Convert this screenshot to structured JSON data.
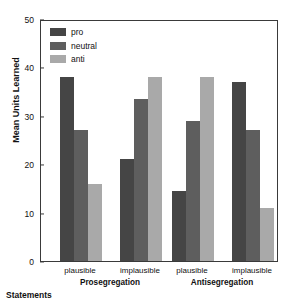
{
  "chart_data": {
    "type": "bar",
    "title": "",
    "xlabel": "Statements",
    "ylabel": "Mean Units Learned",
    "ylim": [
      0,
      50
    ],
    "yticks": [
      0,
      10,
      20,
      30,
      40,
      50
    ],
    "grid": false,
    "legend_position": "top-left",
    "categories": [
      "Prosegregation / plausible",
      "Prosegregation / implausible",
      "Antisegregation / plausible",
      "Antisegregation / implausible"
    ],
    "group_labels": [
      "Prosegregation",
      "Antisegregation"
    ],
    "subgroup_labels": [
      "plausible",
      "implausible",
      "plausible",
      "implausible"
    ],
    "series": [
      {
        "name": "pro",
        "color": "#454545",
        "values": [
          38,
          21,
          14.5,
          37
        ]
      },
      {
        "name": "neutral",
        "color": "#5e5e5e",
        "values": [
          27,
          33.5,
          29,
          27
        ]
      },
      {
        "name": "anti",
        "color": "#a9a9a9",
        "values": [
          16,
          38,
          38,
          11
        ]
      }
    ]
  },
  "axes": {
    "y_title": "Mean Units Learned",
    "x_title": "Statements",
    "y_tick_labels": [
      "0",
      "10",
      "20",
      "30",
      "40",
      "50"
    ]
  },
  "legend": {
    "items": [
      {
        "label": "pro",
        "color": "#454545"
      },
      {
        "label": "neutral",
        "color": "#5e5e5e"
      },
      {
        "label": "anti",
        "color": "#a9a9a9"
      }
    ]
  },
  "xaxis": {
    "subgroups": [
      "plausible",
      "implausible",
      "plausible",
      "implausible"
    ],
    "groups": [
      "Prosegregation",
      "Antisegregation"
    ]
  }
}
